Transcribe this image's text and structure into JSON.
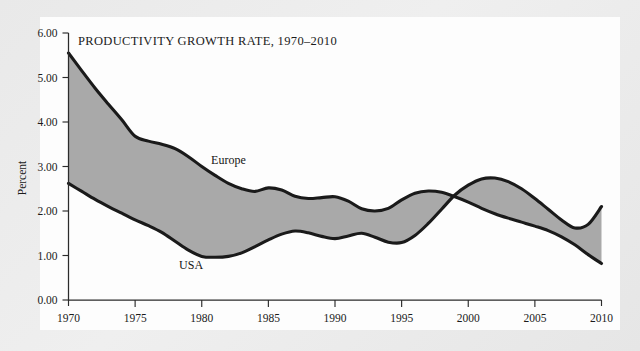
{
  "figure": {
    "background_color": "#ebebeb",
    "card_color": "#fdfdfd"
  },
  "chart_data": {
    "type": "area",
    "title": "PRODUCTIVITY GROWTH RATE, 1970–2010",
    "xlabel": "",
    "ylabel": "Percent",
    "xlim": [
      1970,
      2010
    ],
    "ylim": [
      0.0,
      6.0
    ],
    "grid": false,
    "legend_position": "inline-annotations",
    "axis_color": "#2b2b2b",
    "fill_color": "#a9a9a9",
    "line_color": "#1a1a1a",
    "ytick_labels": [
      "0.00",
      "1.00",
      "2.00",
      "3.00",
      "4.00",
      "5.00",
      "6.00"
    ],
    "ytick_values": [
      0.0,
      1.0,
      2.0,
      3.0,
      4.0,
      5.0,
      6.0
    ],
    "xtick_labels": [
      "1970",
      "1975",
      "1980",
      "1985",
      "1990",
      "1995",
      "2000",
      "2005",
      "2010"
    ],
    "xtick_values": [
      1970,
      1975,
      1980,
      1985,
      1990,
      1995,
      2000,
      2005,
      2010
    ],
    "annotations": [
      {
        "text": "Europe",
        "x": 1982.0,
        "y": 3.05
      },
      {
        "text": "USA",
        "x": 1979.2,
        "y": 0.7
      }
    ],
    "x": [
      1970,
      1971,
      1972,
      1973,
      1974,
      1975,
      1976,
      1977,
      1978,
      1979,
      1980,
      1981,
      1982,
      1983,
      1984,
      1985,
      1986,
      1987,
      1988,
      1989,
      1990,
      1991,
      1992,
      1993,
      1994,
      1995,
      1996,
      1997,
      1998,
      1999,
      2000,
      2001,
      2002,
      2003,
      2004,
      2005,
      2006,
      2007,
      2008,
      2009,
      2010
    ],
    "series": [
      {
        "name": "Europe",
        "values": [
          5.55,
          5.15,
          4.76,
          4.4,
          4.05,
          3.68,
          3.57,
          3.5,
          3.4,
          3.22,
          3.0,
          2.8,
          2.62,
          2.5,
          2.44,
          2.52,
          2.47,
          2.33,
          2.28,
          2.3,
          2.32,
          2.22,
          2.05,
          2.0,
          2.06,
          2.25,
          2.4,
          2.45,
          2.42,
          2.32,
          2.2,
          2.06,
          1.94,
          1.84,
          1.75,
          1.66,
          1.56,
          1.42,
          1.24,
          1.02,
          0.82
        ]
      },
      {
        "name": "USA",
        "values": [
          2.62,
          2.44,
          2.26,
          2.1,
          1.95,
          1.8,
          1.67,
          1.52,
          1.32,
          1.12,
          0.98,
          0.96,
          0.98,
          1.06,
          1.2,
          1.35,
          1.48,
          1.55,
          1.51,
          1.43,
          1.38,
          1.44,
          1.5,
          1.41,
          1.3,
          1.29,
          1.45,
          1.72,
          2.04,
          2.36,
          2.58,
          2.72,
          2.74,
          2.66,
          2.5,
          2.28,
          2.04,
          1.8,
          1.62,
          1.7,
          2.1
        ]
      }
    ]
  }
}
